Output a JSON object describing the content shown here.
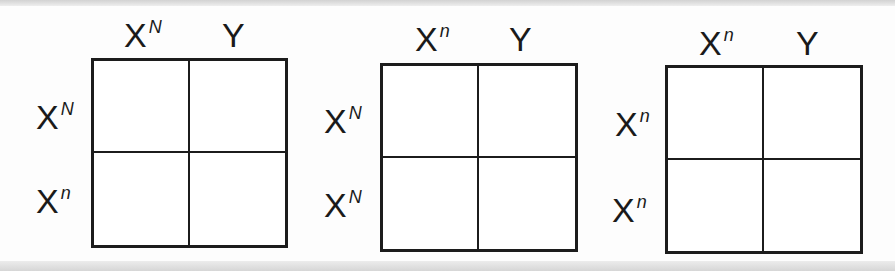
{
  "diagram": {
    "title": "",
    "type": "Punnett squares",
    "squares": [
      {
        "columns": [
          {
            "base": "X",
            "sup": "N"
          },
          {
            "base": "Y",
            "sup": ""
          }
        ],
        "rows": [
          {
            "base": "X",
            "sup": "N"
          },
          {
            "base": "X",
            "sup": "n"
          }
        ],
        "cells": [
          "",
          "",
          "",
          ""
        ]
      },
      {
        "columns": [
          {
            "base": "X",
            "sup": "n"
          },
          {
            "base": "Y",
            "sup": ""
          }
        ],
        "rows": [
          {
            "base": "X",
            "sup": "N"
          },
          {
            "base": "X",
            "sup": "N"
          }
        ],
        "cells": [
          "",
          "",
          "",
          ""
        ]
      },
      {
        "columns": [
          {
            "base": "X",
            "sup": "n"
          },
          {
            "base": "Y",
            "sup": ""
          }
        ],
        "rows": [
          {
            "base": "X",
            "sup": "n"
          },
          {
            "base": "X",
            "sup": "n"
          }
        ],
        "cells": [
          "",
          "",
          "",
          ""
        ]
      }
    ]
  },
  "colors": {
    "line": "#1c1c1c",
    "background": "#fdfdfd"
  }
}
